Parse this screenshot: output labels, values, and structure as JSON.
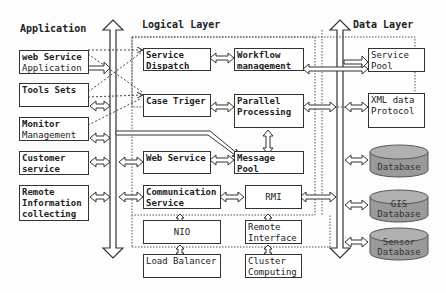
{
  "headers": {
    "application": "Application",
    "logical": "Logical Layer",
    "data": "Data Layer"
  },
  "application": [
    {
      "line1": "web Service",
      "line2": "Application"
    },
    {
      "line1": "Tools Sets",
      "line2": ""
    },
    {
      "line1": "Monitor",
      "line2": "Management"
    },
    {
      "line1": "Customer",
      "line2": "service"
    },
    {
      "line1": "Remote",
      "line2": "Information",
      "line3": "collecting"
    }
  ],
  "logical": {
    "service_dispatch": {
      "line1": "Service",
      "line2": "Dispatch"
    },
    "workflow": {
      "line1": "Workflow",
      "line2": "management"
    },
    "case_triger": "Case Triger",
    "parallel": {
      "line1": "Parallel",
      "line2": "Processing"
    },
    "web_service": "Web Service",
    "message_pool": "Message Pool",
    "communication": {
      "line1": "Communication",
      "line2": "Service"
    },
    "rmi": "RMI",
    "nio": "NIO",
    "remote_interface": {
      "line1": "Remote",
      "line2": "Interface"
    },
    "load_balancer": "Load Balancer",
    "cluster": {
      "line1": "Cluster",
      "line2": "Computing"
    }
  },
  "data_layer": {
    "service_pool": {
      "line1": "Service",
      "line2": "Pool"
    },
    "xml": {
      "line1": "XML data",
      "line2": "Protocol"
    },
    "databases": [
      {
        "line1": "Database",
        "line2": ""
      },
      {
        "line1": "GIS",
        "line2": "Database"
      },
      {
        "line1": "Sensor",
        "line2": "Database"
      }
    ]
  },
  "colors": {
    "db_fill": "#9a9a9a",
    "stroke": "#333333"
  }
}
